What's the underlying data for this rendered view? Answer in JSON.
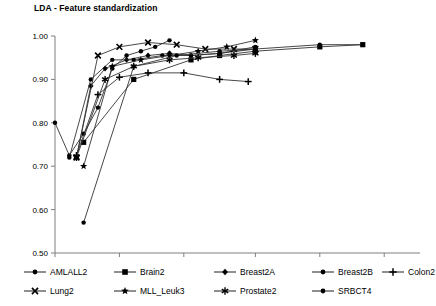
{
  "chart": {
    "title": "LDA - Feature standardization"
  },
  "chart_data": {
    "type": "line",
    "title": "LDA - Feature standardization",
    "xlabel": "",
    "ylabel": "",
    "xlim": [
      1,
      52
    ],
    "ylim": [
      0.5,
      1.0
    ],
    "grid": false,
    "legend_position": "bottom",
    "xticks": [
      1,
      10,
      19,
      29,
      38,
      47
    ],
    "xtick_labels": [
      "1",
      "10",
      "19",
      "29",
      "38",
      "47"
    ],
    "yticks": [
      0.5,
      0.6,
      0.7,
      0.8,
      0.9,
      1.0
    ],
    "ytick_labels": [
      "0.50",
      "0.60",
      "0.70",
      "0.80",
      "0.90",
      "1.00"
    ],
    "series": [
      {
        "name": "AMLALL2",
        "marker": "circle",
        "x": [
          1,
          3,
          5,
          7,
          9,
          11,
          13,
          15,
          17
        ],
        "values": [
          0.8,
          0.725,
          0.775,
          0.835,
          0.925,
          0.955,
          0.965,
          0.975,
          0.99
        ]
      },
      {
        "name": "Brain2",
        "marker": "square",
        "x": [
          5,
          12,
          20,
          24,
          29,
          38,
          44
        ],
        "values": [
          0.755,
          0.9,
          0.945,
          0.955,
          0.965,
          0.975,
          0.98
        ]
      },
      {
        "name": "Breast2A",
        "marker": "diamond",
        "x": [
          4,
          6,
          8,
          11,
          14,
          17,
          20,
          24,
          29
        ],
        "values": [
          0.72,
          0.885,
          0.925,
          0.945,
          0.955,
          0.96,
          0.955,
          0.96,
          0.97
        ]
      },
      {
        "name": "Breast2B",
        "marker": "circle",
        "x": [
          3,
          6,
          9,
          12,
          16,
          20,
          24,
          29
        ],
        "values": [
          0.72,
          0.9,
          0.945,
          0.945,
          0.955,
          0.955,
          0.96,
          0.975
        ]
      },
      {
        "name": "Colon2",
        "marker": "plus",
        "x": [
          4,
          7,
          10,
          14,
          19,
          24,
          28
        ],
        "values": [
          0.725,
          0.865,
          0.905,
          0.915,
          0.915,
          0.9,
          0.895
        ]
      },
      {
        "name": "Lung2",
        "marker": "x",
        "x": [
          4,
          7,
          10,
          14,
          18,
          22,
          26,
          29
        ],
        "values": [
          0.72,
          0.955,
          0.975,
          0.985,
          0.98,
          0.97,
          0.97,
          0.97
        ]
      },
      {
        "name": "MLL_Leuk3",
        "marker": "star",
        "x": [
          5,
          9,
          13,
          17,
          21,
          25,
          29
        ],
        "values": [
          0.7,
          0.93,
          0.945,
          0.955,
          0.965,
          0.975,
          0.99
        ]
      },
      {
        "name": "Prostate2",
        "marker": "asterisk",
        "x": [
          4,
          8,
          12,
          17,
          21,
          26,
          29
        ],
        "values": [
          0.72,
          0.9,
          0.93,
          0.945,
          0.95,
          0.955,
          0.96
        ]
      },
      {
        "name": "SRBCT4",
        "marker": "circle",
        "x": [
          5,
          12,
          18,
          24,
          29,
          38,
          44
        ],
        "values": [
          0.57,
          0.93,
          0.955,
          0.965,
          0.97,
          0.98,
          0.98
        ]
      }
    ]
  },
  "legend": {
    "rows": [
      [
        {
          "label": "AMLALL2",
          "marker": "circle"
        },
        {
          "label": "Brain2",
          "marker": "square"
        },
        {
          "label": "Breast2A",
          "marker": "diamond"
        },
        {
          "label": "Breast2B",
          "marker": "circle"
        },
        {
          "label": "Colon2",
          "marker": "plus"
        }
      ],
      [
        {
          "label": "Lung2",
          "marker": "x"
        },
        {
          "label": "MLL_Leuk3",
          "marker": "star"
        },
        {
          "label": "Prostate2",
          "marker": "asterisk"
        },
        {
          "label": "SRBCT4",
          "marker": "circle"
        }
      ]
    ]
  },
  "style": {
    "line_color": "#333333",
    "marker_color": "#000000",
    "axis_color": "#7f7f7f"
  }
}
